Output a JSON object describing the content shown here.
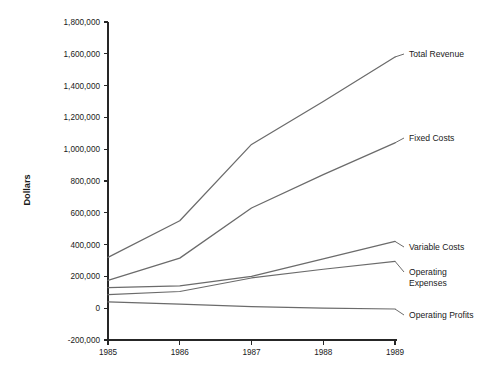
{
  "chart_data": {
    "type": "line",
    "title": "",
    "xlabel": "",
    "ylabel": "Dollars",
    "categories": [
      "1985",
      "1986",
      "1987",
      "1988",
      "1989"
    ],
    "x": [
      1985,
      1986,
      1987,
      1988,
      1989
    ],
    "ylim": [
      -200000,
      1800000
    ],
    "xlim": [
      1985,
      1989
    ],
    "grid": false,
    "legend_position": "right-inline-labels",
    "ytick_labels": [
      "1,800,000",
      "1,600,000",
      "1,400,000",
      "1,200,000",
      "1,000,000",
      "800,000",
      "600,000",
      "400,000",
      "200,000",
      "0",
      "-200,000"
    ],
    "ytick_values": [
      1800000,
      1600000,
      1400000,
      1200000,
      1000000,
      800000,
      600000,
      400000,
      200000,
      0,
      -200000
    ],
    "xtick_labels": [
      "1985",
      "1986",
      "1987",
      "1988",
      "1989"
    ],
    "line_color": "#6b6b6b",
    "axis_color": "#262626",
    "series": [
      {
        "name": "Total Revenue",
        "label": "Total Revenue",
        "values": [
          320000,
          550000,
          1030000,
          1300000,
          1580000
        ],
        "color": "#6b6b6b"
      },
      {
        "name": "Fixed Costs",
        "label": "Fixed Costs",
        "values": [
          175000,
          315000,
          630000,
          840000,
          1040000
        ],
        "color": "#6b6b6b"
      },
      {
        "name": "Variable Costs",
        "label": "Variable Costs",
        "values": [
          130000,
          140000,
          200000,
          310000,
          420000
        ],
        "color": "#6b6b6b"
      },
      {
        "name": "Operating Expenses",
        "label": "Operating Expenses",
        "label_line1": "Operating",
        "label_line2": "Expenses",
        "values": [
          85000,
          105000,
          190000,
          245000,
          295000
        ],
        "color": "#6b6b6b"
      },
      {
        "name": "Operating Profits",
        "label": "Operating Profits",
        "values": [
          40000,
          25000,
          10000,
          0,
          -5000
        ],
        "color": "#6b6b6b"
      }
    ]
  }
}
